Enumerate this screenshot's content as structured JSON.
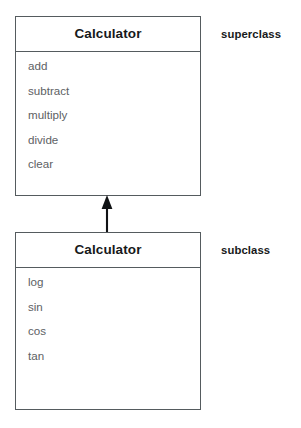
{
  "diagram": {
    "type": "uml-class-inheritance",
    "title_text": "Calculator",
    "classes": [
      {
        "role": "superclass",
        "name": "Calculator",
        "side_label": "superclass",
        "members": [
          "add",
          "subtract",
          "multiply",
          "divide",
          "clear"
        ]
      },
      {
        "role": "subclass",
        "name": "Calculator",
        "side_label": "subclass",
        "members": [
          "log",
          "sin",
          "cos",
          "tan"
        ]
      }
    ],
    "relationship": {
      "kind": "generalization",
      "arrow_icon": "inheritance-arrow-up",
      "from": "subclass",
      "to": "superclass"
    },
    "colors": {
      "background": "#ffffff",
      "border": "#555b5e",
      "title_text": "#17191a",
      "member_text": "#5d6164",
      "label_text": "#17191a",
      "arrow": "#111315"
    }
  }
}
